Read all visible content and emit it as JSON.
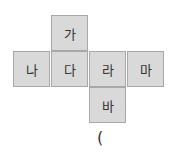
{
  "net": {
    "cells": [
      {
        "label": "가",
        "row": 0,
        "col": 1
      },
      {
        "label": "나",
        "row": 1,
        "col": 0
      },
      {
        "label": "다",
        "row": 1,
        "col": 1
      },
      {
        "label": "라",
        "row": 1,
        "col": 2
      },
      {
        "label": "마",
        "row": 1,
        "col": 3
      },
      {
        "label": "바",
        "row": 2,
        "col": 2
      }
    ]
  },
  "answer": {
    "open_paren": "("
  }
}
